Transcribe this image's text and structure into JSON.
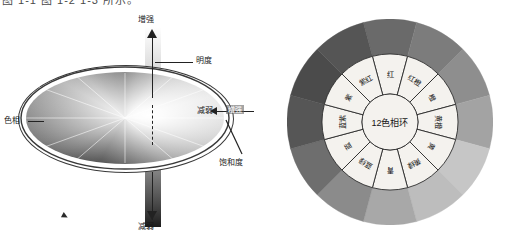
{
  "page": {
    "top_cut_text": "图 1-1  图 1-2    1-3 所示。",
    "background": "#ffffff"
  },
  "left_diagram": {
    "name": "hsb-color-model-diagram",
    "labels": {
      "top_axis": "增强",
      "bottom_axis": "减弱",
      "brightness": "明度",
      "hue": "色相",
      "saturation": "饱和度",
      "saturation_decrease": "减弱",
      "saturation_increase": "增强"
    },
    "colors": {
      "axis": "#222222",
      "outline": "#3a3a3a",
      "bar_top_light": "#ffffff",
      "bar_top_dark": "#ababab",
      "bar_bottom_light": "#8e8e8e",
      "bar_bottom_dark": "#1c1c1c"
    }
  },
  "color_wheel": {
    "name": "twelve-hue-color-wheel",
    "center_label": "12色相环",
    "segment_count": 12,
    "segments": [
      {
        "label": "红",
        "angle_deg": 0,
        "gray": "#6a6a6a"
      },
      {
        "label": "红橙",
        "angle_deg": 30,
        "gray": "#7c7c7c"
      },
      {
        "label": "橙",
        "angle_deg": 60,
        "gray": "#8e8e8e"
      },
      {
        "label": "黄橙",
        "angle_deg": 90,
        "gray": "#a3a3a3"
      },
      {
        "label": "黄",
        "angle_deg": 120,
        "gray": "#c6c6c6"
      },
      {
        "label": "黄绿",
        "angle_deg": 150,
        "gray": "#bdbdbd"
      },
      {
        "label": "青",
        "angle_deg": 180,
        "gray": "#a8a8a8"
      },
      {
        "label": "蓝绿",
        "angle_deg": 210,
        "gray": "#8b8b8b"
      },
      {
        "label": "蓝",
        "angle_deg": 240,
        "gray": "#6e6e6e"
      },
      {
        "label": "蓝紫",
        "angle_deg": 270,
        "gray": "#565656"
      },
      {
        "label": "紫",
        "angle_deg": 300,
        "gray": "#4b4b4b"
      },
      {
        "label": "紫红",
        "angle_deg": 330,
        "gray": "#555555"
      }
    ],
    "inner_ring_fill": "#f4f2ee",
    "stroke": "#2a2a2a"
  }
}
